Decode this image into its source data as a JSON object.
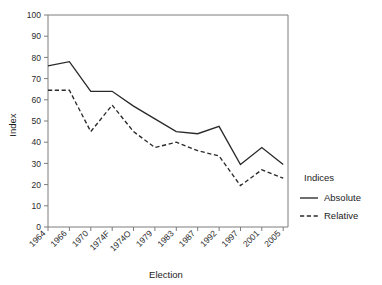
{
  "chart_data": {
    "type": "line",
    "title": "",
    "xlabel": "Election",
    "ylabel": "Index",
    "categories": [
      "1964",
      "1966",
      "1970",
      "1974F",
      "1974O",
      "1979",
      "1983",
      "1987",
      "1992",
      "1997",
      "2001",
      "2005"
    ],
    "ylim": [
      0,
      100
    ],
    "yticks": [
      0,
      10,
      20,
      30,
      40,
      50,
      60,
      70,
      80,
      90,
      100
    ],
    "grid": false,
    "legend_title": "Indices",
    "legend_position": "right",
    "series": [
      {
        "name": "Absolute",
        "style": "solid",
        "color": "#2a2a2a",
        "values": [
          76,
          78,
          64,
          64,
          57,
          51,
          45,
          44,
          47.5,
          29.5,
          37.5,
          29.5
        ]
      },
      {
        "name": "Relative",
        "style": "dashed",
        "color": "#2a2a2a",
        "values": [
          64.5,
          64.5,
          45,
          57.5,
          45,
          37.5,
          40,
          36,
          33.5,
          19.5,
          27,
          23
        ]
      }
    ]
  },
  "axis": {
    "y_label": "Index",
    "x_label": "Election",
    "y_tick_labels": [
      "100",
      "90",
      "80",
      "70",
      "60",
      "50",
      "40",
      "30",
      "20",
      "10",
      "0"
    ],
    "x_tick_labels": [
      "1964",
      "1966",
      "1970",
      "1974F",
      "1974O",
      "1979",
      "1983",
      "1987",
      "1992",
      "1997",
      "2001",
      "2005"
    ]
  },
  "legend": {
    "title": "Indices",
    "entries": [
      {
        "label": "Absolute",
        "style": "solid"
      },
      {
        "label": "Relative",
        "style": "dashed"
      }
    ]
  }
}
